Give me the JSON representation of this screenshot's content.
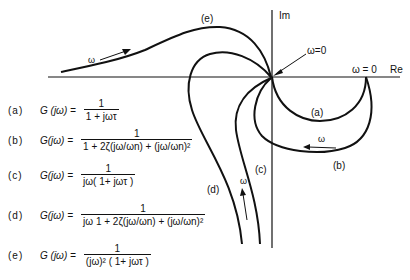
{
  "axes": {
    "im_label": "Im",
    "re_label": "Re",
    "omega_zero_origin": "ω=0",
    "omega_zero_real": "ω = 0"
  },
  "curve_labels": {
    "a": "(a)",
    "b": "(b)",
    "c": "(c)",
    "d": "(d)",
    "e": "(e)"
  },
  "direction_labels": {
    "e": "ω",
    "b": "ω",
    "d": "ω"
  },
  "equations": [
    {
      "tag": "(a)",
      "lhs": "G (jω) =",
      "numerator": "1",
      "denominator": "1 + jωτ"
    },
    {
      "tag": "(b)",
      "lhs": "G(jω) =",
      "numerator": "1",
      "denominator": "1 + 2ζ(jω/ωn) + (jω/ωn)²"
    },
    {
      "tag": "(c)",
      "lhs": "G(jω) =",
      "numerator": "1",
      "denominator": "jω( 1+ jωτ )"
    },
    {
      "tag": "(d)",
      "lhs": "G(jω) =",
      "numerator": "1",
      "denominator": "jω 1 + 2ζ(jω/ωn) + (jω/ωn)²"
    },
    {
      "tag": "(e)",
      "lhs": "G (jω) =",
      "numerator": "1",
      "denominator": "(jω)² ( 1+ jωτ )"
    }
  ],
  "colors": {
    "ink": "#111111",
    "background": "#ffffff"
  }
}
